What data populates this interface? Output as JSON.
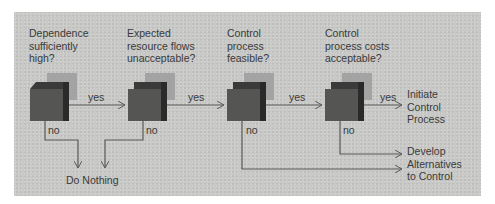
{
  "diagram": {
    "type": "decision-flowchart",
    "colors": {
      "background": "#c9c9c7",
      "cube_front": "#555554",
      "cube_top": "#3a3a3a",
      "cube_side": "#2a2a2a",
      "cube_shadow": "#a3a3a3",
      "line": "#5a5a5a",
      "text": "#3a3a3a"
    },
    "decisions": [
      {
        "question": "Dependence\nsufficiently\nhigh?",
        "yes_label": "yes",
        "no_label": "no"
      },
      {
        "question": "Expected\nresource flows\nunacceptable?",
        "yes_label": "yes",
        "no_label": "no"
      },
      {
        "question": "Control\nprocess\nfeasible?",
        "yes_label": "yes",
        "no_label": "no"
      },
      {
        "question": "Control\nprocess costs\nacceptable?",
        "yes_label": "yes",
        "no_label": "no"
      }
    ],
    "outcomes": {
      "initiate": "Initiate\nControl\nProcess",
      "do_nothing": "Do Nothing",
      "alternatives": "Develop\nAlternatives\nto Control"
    }
  }
}
